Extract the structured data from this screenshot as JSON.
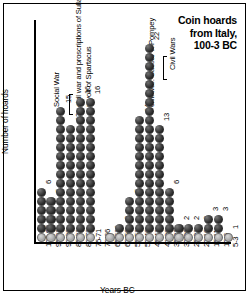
{
  "title": {
    "line1": "Coin hoards",
    "line2": "from Italy,",
    "line3": "100-3 BC"
  },
  "axes": {
    "ylabel": "Number of hoards",
    "xlabel": "Years BC"
  },
  "annotations": [
    {
      "id": "social-war",
      "text": "Social War"
    },
    {
      "id": "sulla",
      "text": "civil war and proscriptions of Sulla"
    },
    {
      "id": "spartacus",
      "text": "revolt of Spartacus"
    },
    {
      "id": "caesar-pompey",
      "text": "civil war: Caesar v. Pompey"
    },
    {
      "id": "civil-wars",
      "text": "Civil Wars"
    }
  ],
  "chart_data": {
    "type": "bar",
    "title": "Coin hoards from Italy, 100-3 BC",
    "xlabel": "Years BC",
    "ylabel": "Number of hoards",
    "grid": false,
    "legend": false,
    "ylim": [
      0,
      22
    ],
    "categories": [
      "100-96",
      "95-91",
      "90-86",
      "85-81",
      "80-73",
      "75-71",
      "70-66",
      "65-61",
      "60-56",
      "55-51",
      "50-46",
      "45-41",
      "41-36",
      "35-31",
      "30-26",
      "25-21",
      "20-16",
      "15-11",
      "10-6",
      "5-3"
    ],
    "values": [
      6,
      5,
      15,
      13,
      16,
      16,
      0,
      1,
      2,
      5,
      14,
      22,
      13,
      6,
      2,
      2,
      2,
      3,
      3,
      1
    ],
    "value_labels": [
      "6",
      "5",
      "15",
      "13",
      "16",
      "16",
      "",
      "1",
      "2",
      "5",
      "14",
      "22",
      "13",
      "6",
      "2",
      "2",
      "2",
      "3",
      "3",
      "1"
    ]
  }
}
